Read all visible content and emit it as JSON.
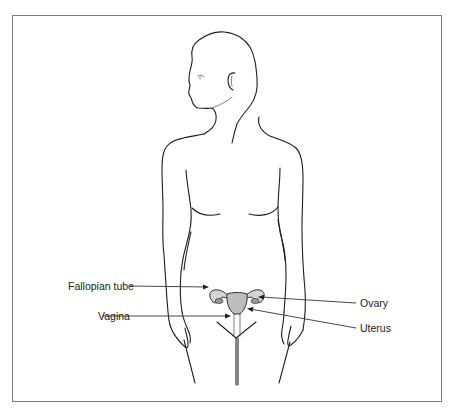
{
  "figure": {
    "labels": {
      "fallopian_tube": "Fallopian tube",
      "vagina": "Vagina",
      "ovary": "Ovary",
      "uterus": "Uterus"
    },
    "colors": {
      "outline": "#1e1e1e",
      "organ_fill": "#bdbdbd",
      "frame": "#7a7a7a"
    }
  }
}
